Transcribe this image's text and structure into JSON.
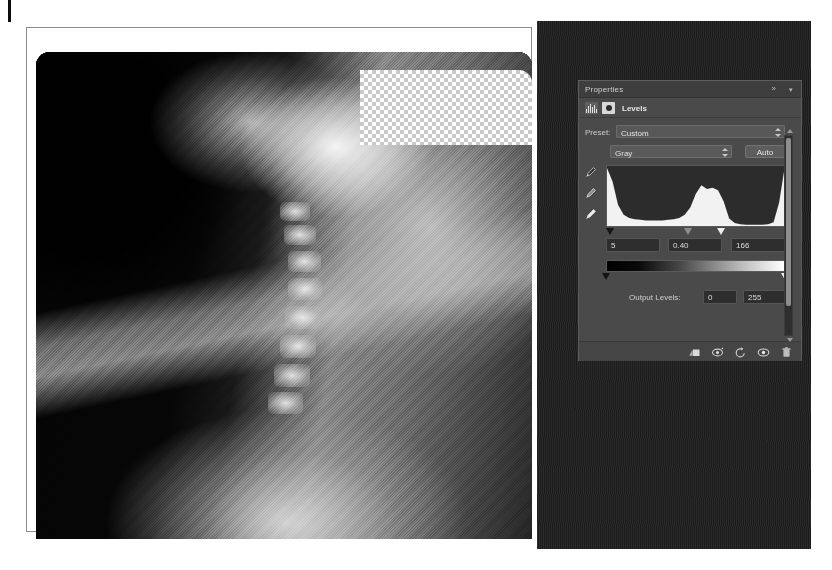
{
  "document": {
    "canvas_label": "cervical-spine-radiograph",
    "transparency_region_label": "transparency-checkerboard"
  },
  "panel": {
    "tab_title": "Properties",
    "collapse_icon": "»",
    "menu_icon": "▾",
    "adjustment_title": "Levels",
    "histogram_icon_name": "histogram-icon",
    "mask_icon_name": "layer-mask-icon"
  },
  "preset": {
    "label": "Preset:",
    "value": "Custom",
    "options": [
      "Default",
      "Custom",
      "Darker",
      "Increase Contrast 1",
      "Increase Contrast 2",
      "Increase Contrast 3",
      "Lighten Shadows",
      "Midtones Brighter",
      "Midtones Darker"
    ]
  },
  "channel": {
    "value": "Gray",
    "options": [
      "Gray"
    ],
    "auto_label": "Auto"
  },
  "eyedroppers": [
    {
      "name": "set-black-point-eyedropper"
    },
    {
      "name": "set-gray-point-eyedropper"
    },
    {
      "name": "set-white-point-eyedropper"
    }
  ],
  "input_levels": {
    "shadow": "5",
    "midtone": "0.40",
    "highlight": "166",
    "shadow_slider_pct": 2,
    "midtone_slider_pct": 46,
    "highlight_slider_pct": 64
  },
  "output_levels": {
    "label": "Output Levels:",
    "black": "0",
    "white": "255",
    "black_slider_pct": 0,
    "white_slider_pct": 100
  },
  "footer_buttons": [
    {
      "name": "clip-to-layer-button",
      "title": "Clip to layer"
    },
    {
      "name": "view-previous-state-button",
      "title": "View previous state"
    },
    {
      "name": "reset-button",
      "title": "Reset to default"
    },
    {
      "name": "toggle-layer-visibility-button",
      "title": "Toggle layer visibility"
    },
    {
      "name": "delete-layer-button",
      "title": "Delete this adjustment layer"
    }
  ],
  "chart_data": {
    "type": "bar",
    "xlabel": "Tonal value (0-255)",
    "ylabel": "Pixel count",
    "xlim": [
      0,
      255
    ],
    "grid": false,
    "legend": "none",
    "categories": [
      0,
      8,
      16,
      24,
      32,
      40,
      48,
      56,
      64,
      72,
      80,
      88,
      96,
      104,
      112,
      120,
      128,
      136,
      144,
      152,
      160,
      168,
      176,
      184,
      192,
      200,
      208,
      216,
      224,
      232,
      240,
      248,
      255
    ],
    "values": [
      94,
      72,
      34,
      18,
      13,
      11,
      10,
      9,
      9,
      9,
      9,
      10,
      11,
      13,
      18,
      30,
      52,
      66,
      60,
      62,
      58,
      40,
      12,
      5,
      3,
      2,
      2,
      2,
      2,
      3,
      6,
      38,
      88
    ],
    "markers": {
      "black_input": 5,
      "gamma": 0.4,
      "white_input": 166,
      "black_output": 0,
      "white_output": 255
    }
  }
}
